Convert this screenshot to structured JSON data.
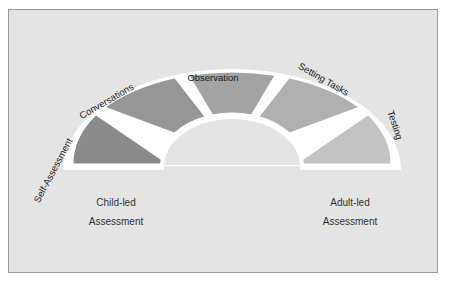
{
  "diagram": {
    "segments": [
      {
        "label": "Self-Assessment",
        "color": "#8a8a8a"
      },
      {
        "label": "Conversations",
        "color": "#969696"
      },
      {
        "label": "Observation",
        "color": "#a3a3a3"
      },
      {
        "label": "Setting Tasks",
        "color": "#b0b0b0"
      },
      {
        "label": "Testing",
        "color": "#c3c3c3"
      }
    ],
    "left_caption": {
      "line1": "Child-led",
      "line2": "Assessment"
    },
    "right_caption": {
      "line1": "Adult-led",
      "line2": "Assessment"
    },
    "colors": {
      "background": "#e4e4e4",
      "border": "#9a9a9a",
      "separator": "#ffffff"
    }
  }
}
